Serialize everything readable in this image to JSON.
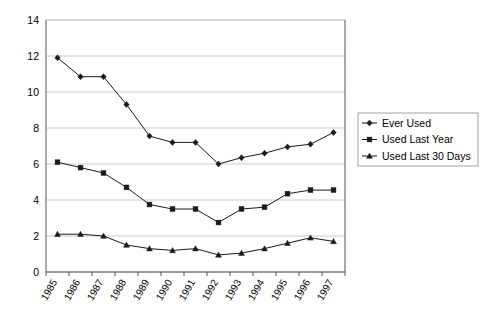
{
  "chart_data": {
    "type": "line",
    "title": "",
    "subtitle": "",
    "xlabel": "",
    "ylabel": "",
    "categories": [
      "1985",
      "1986",
      "1987",
      "1988",
      "1989",
      "1990",
      "1991",
      "1992",
      "1993",
      "1994",
      "1995",
      "1996",
      "1997"
    ],
    "ylim": [
      0,
      14
    ],
    "yticks": [
      0,
      2,
      4,
      6,
      8,
      10,
      12,
      14
    ],
    "ytick_labels": [
      "0",
      "2",
      "4",
      "6",
      "8",
      "10",
      "12",
      "14"
    ],
    "grid": "horizontal",
    "legend_position": "right",
    "series": [
      {
        "name": "Ever Used",
        "marker": "diamond",
        "color": "#1a1a1a",
        "values": [
          11.9,
          10.85,
          10.85,
          9.3,
          7.55,
          7.2,
          7.2,
          6.0,
          6.35,
          6.6,
          6.95,
          7.1,
          7.75
        ]
      },
      {
        "name": "Used Last Year",
        "marker": "square",
        "color": "#1a1a1a",
        "values": [
          6.1,
          5.8,
          5.5,
          4.7,
          3.75,
          3.5,
          3.5,
          2.75,
          3.5,
          3.6,
          4.35,
          4.55,
          4.55
        ]
      },
      {
        "name": "Used Last 30 Days",
        "marker": "triangle",
        "color": "#1a1a1a",
        "values": [
          2.1,
          2.1,
          2.0,
          1.5,
          1.3,
          1.2,
          1.3,
          0.95,
          1.05,
          1.3,
          1.6,
          1.9,
          1.7
        ]
      }
    ]
  },
  "legend": {
    "items": [
      {
        "label": "Ever Used"
      },
      {
        "label": "Used Last Year"
      },
      {
        "label": "Used Last 30 Days"
      }
    ]
  },
  "colors": {
    "gridline": "#b4b4b4",
    "axis": "#555555",
    "ink": "#1a1a1a",
    "background": "#ffffff"
  }
}
